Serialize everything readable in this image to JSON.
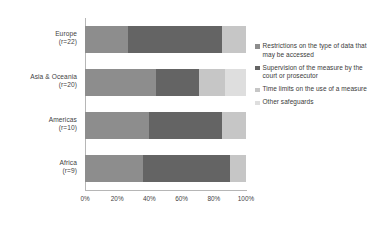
{
  "chart_data": {
    "type": "bar",
    "orientation": "horizontal",
    "stacked": true,
    "stack_mode": "percent",
    "title": "",
    "subtitle": "",
    "xlabel": "",
    "ylabel": "",
    "xlim": [
      0,
      100
    ],
    "grid": false,
    "legend_position": "right",
    "xtick_labels": [
      "0%",
      "20%",
      "40%",
      "60%",
      "80%",
      "100%"
    ],
    "xtick_values": [
      0,
      20,
      40,
      60,
      80,
      100
    ],
    "categories": [
      "Europe (r=22)",
      "Asia & Oceania (r=20)",
      "Americas (r=10)",
      "Africa (r=9)"
    ],
    "category_rows": [
      {
        "name": "Europe",
        "responses": "(r=22)"
      },
      {
        "name": "Asia & Oceania",
        "responses": "(r=20)"
      },
      {
        "name": "Americas",
        "responses": "(r=10)"
      },
      {
        "name": "Africa",
        "responses": "(r=9)"
      }
    ],
    "series": [
      {
        "name": "Restrictions on the type of data that may be accessed",
        "color": "#8d8d8d",
        "values": [
          27,
          44,
          40,
          36
        ]
      },
      {
        "name": "Supervision of the measure by the court or prosecutor",
        "color": "#646464",
        "values": [
          58,
          27,
          45,
          54
        ]
      },
      {
        "name": "Time limits on the use of a measure",
        "color": "#c6c6c6",
        "values": [
          15,
          16,
          15,
          10
        ]
      },
      {
        "name": "Other safeguards",
        "color": "#dedede",
        "values": [
          0,
          13,
          0,
          0
        ]
      }
    ]
  },
  "legend": {
    "items": [
      {
        "label": "Restrictions on the type of data that may be accessed",
        "color": "#8d8d8d"
      },
      {
        "label": "Supervision of the measure by the court or prosecutor",
        "color": "#646464"
      },
      {
        "label": "Time limits on the use of a measure",
        "color": "#c6c6c6"
      },
      {
        "label": "Other safeguards",
        "color": "#dedede"
      }
    ]
  },
  "axis": {
    "line_color": "#b6b6b6"
  }
}
